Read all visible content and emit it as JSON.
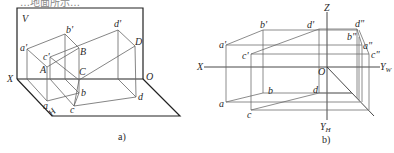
{
  "top_fragment": "…地面所示…",
  "diagram_a": {
    "caption": "a)",
    "plane_labels": {
      "V": "V",
      "H": "H"
    },
    "axis_labels": {
      "X": "X",
      "O": "O"
    },
    "points": {
      "a_prime": "a'",
      "b_prime": "b'",
      "c_prime": "c'",
      "d_prime": "d'",
      "A": "A",
      "B": "B",
      "C": "C",
      "D": "D",
      "a": "a",
      "b": "b",
      "c": "c",
      "d": "d"
    }
  },
  "diagram_b": {
    "caption": "b)",
    "axis_labels": {
      "X": "X",
      "Z": "Z",
      "O": "O",
      "Y": "Y",
      "W": "W",
      "H": "H"
    },
    "points": {
      "a_prime": "a'",
      "b_prime": "b'",
      "c_prime": "c'",
      "d_prime": "d'",
      "a_dprime": "a\"",
      "b_dprime": "b\"",
      "c_dprime": "c\"",
      "d_dprime": "d\"",
      "a": "a",
      "b": "b",
      "c": "c",
      "d": "d"
    }
  },
  "colors": {
    "line": "#555555",
    "heavy": "#222222",
    "text": "#2a2a2a"
  }
}
